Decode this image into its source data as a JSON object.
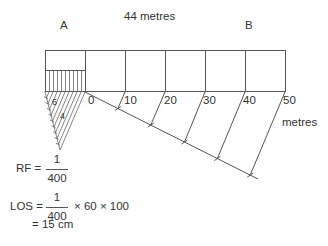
{
  "labels": {
    "point_a": "A",
    "point_b": "B",
    "length": "44 metres",
    "unit": "metres",
    "small_div_6": "6",
    "small_div_4": "4"
  },
  "scale_ticks": [
    "0",
    "10",
    "20",
    "30",
    "40",
    "50"
  ],
  "formulas": {
    "rf_label": "RF =",
    "rf_num": "1",
    "rf_den": "400",
    "los_label": "LOS =",
    "los_num": "1",
    "los_den": "400",
    "los_mult": "× 60 × 100",
    "los_result": "= 15 cm"
  },
  "colors": {
    "line": "#555555",
    "text": "#333333"
  }
}
